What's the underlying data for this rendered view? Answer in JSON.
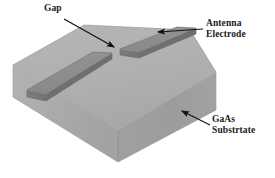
{
  "figure": {
    "title_semantic": "photoconductive-antenna-schematic",
    "background_color": "#ffffff",
    "labels": {
      "gap": {
        "text": "Gap",
        "name": "gap-label"
      },
      "antenna_electrode": {
        "line1": "Antenna",
        "line2": "Electrode",
        "name": "antenna-electrode-label"
      },
      "gaas_substrate": {
        "line1": "GaAs",
        "line2": "Substrtate",
        "name": "gaas-substrate-label"
      }
    },
    "colors": {
      "substrate_top": "#b0b0b0",
      "substrate_front_left": "#a9a9a9",
      "substrate_front_right": "#9e9e9e",
      "electrode_top": "#8e8e8e",
      "electrode_side": "#787878",
      "edge_line": "#8a8a8a",
      "leader_line": "#111111",
      "text": "#1a1a1a"
    },
    "geometry": {
      "substrate": {
        "top_face": "13,65 84,25 190,30 216,72",
        "front_left_face": "13,65 118,162 118,130 13,97",
        "front_right_face": "118,162 216,110 216,72 118,130"
      },
      "electrode_left": {
        "top_face": "27,90 93,52 112,53 46,94",
        "side_face": "27,90 46,94 46,101 27,97"
      },
      "electrode_right": {
        "top_face": "120,49 177,27 196,28 139,52",
        "side_face": "120,49 139,52 139,59 120,56"
      },
      "gap_between_electrodes": "between x=112 and x=120 on top face"
    },
    "leaders": [
      {
        "name": "gap-leader",
        "from": "64,20",
        "to": "117,48",
        "arrow": "at-end"
      },
      {
        "name": "antenna-electrode-leader",
        "from": "203,28",
        "to": "160,32",
        "arrow": "at-end"
      },
      {
        "name": "gaas-substrate-leader",
        "from": "209,124",
        "to": "183,112",
        "arrow": "at-end"
      }
    ]
  }
}
